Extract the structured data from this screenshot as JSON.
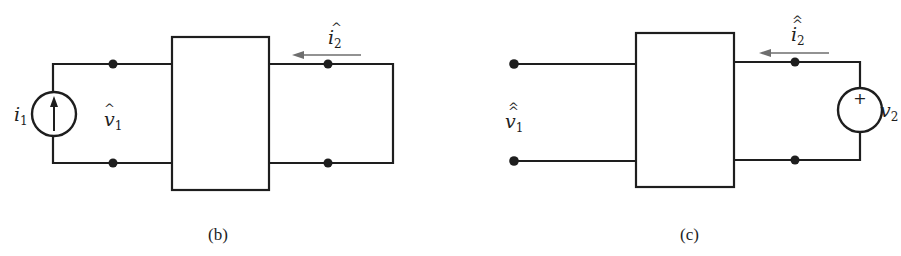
{
  "figure": {
    "panels": [
      {
        "id": "b",
        "caption": "(b)",
        "source": {
          "type": "current-source",
          "label": "i",
          "subscript": "1",
          "direction": "up"
        },
        "port1_label": {
          "symbol": "v",
          "subscript": "1",
          "accent": "^"
        },
        "port2_current": {
          "symbol": "i",
          "subscript": "2",
          "accent": "^",
          "arrow": "left"
        },
        "port2_termination": "short-circuit"
      },
      {
        "id": "c",
        "caption": "(c)",
        "port1_label": {
          "symbol": "v",
          "subscript": "1",
          "accent": "^^"
        },
        "port1_termination": "open-circuit",
        "port2_current": {
          "symbol": "i",
          "subscript": "2",
          "accent": "^^",
          "arrow": "left"
        },
        "source": {
          "type": "voltage-source",
          "label": "v",
          "subscript": "2",
          "polarity": "+"
        }
      }
    ],
    "colors": {
      "line": "#1e1e1e",
      "arrow": "#6e6e6e",
      "background": "#ffffff"
    }
  }
}
